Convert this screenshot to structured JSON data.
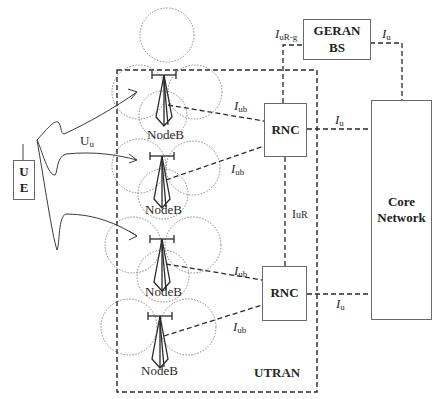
{
  "diagram": {
    "regions": {
      "utran_label": "UTRAN"
    },
    "nodes": {
      "ue": {
        "line1": "U",
        "line2": "E"
      },
      "rnc_top": {
        "label": "RNC"
      },
      "rnc_bottom": {
        "label": "RNC"
      },
      "geran": {
        "line1": "GERAN",
        "line2": "BS"
      },
      "core": {
        "line1": "Core",
        "line2": "Network"
      },
      "nodeb": [
        {
          "label": "NodeB"
        },
        {
          "label": "NodeB"
        },
        {
          "label": "NodeB"
        },
        {
          "label": "NodeB"
        }
      ]
    },
    "interfaces": {
      "uu": {
        "main": "U",
        "sub": "u"
      },
      "iub_1": {
        "main": "I",
        "sub": "ub"
      },
      "iub_2": {
        "main": "I",
        "sub": "ub"
      },
      "iub_3": {
        "main": "I",
        "sub": "ub"
      },
      "iub_4": {
        "main": "I",
        "sub": "ub"
      },
      "iur": {
        "main": "I",
        "sub": "uR"
      },
      "iur_g": {
        "main": "I",
        "sub": "uR-g"
      },
      "iu_geran": {
        "main": "I",
        "sub": "u"
      },
      "iu_top": {
        "main": "I",
        "sub": "u"
      },
      "iu_bottom": {
        "main": "I",
        "sub": "u"
      }
    },
    "colors": {
      "line": "#2a2a2a",
      "box_border": "#6a6a6a",
      "cell_dotted": "#7a7a7a"
    }
  }
}
